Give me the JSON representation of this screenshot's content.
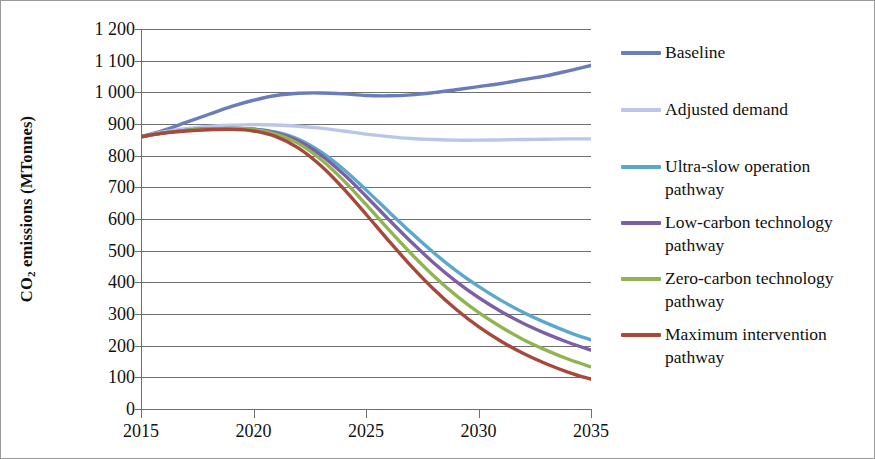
{
  "chart_data": {
    "type": "line",
    "title": "",
    "xlabel": "",
    "ylabel": "CO2 emissions (MTonnes)",
    "ylabel_display": "CO<sub>2</sub> emissions (MTonnes)",
    "grid": true,
    "legend_position": "right",
    "xlim": [
      2014,
      2036
    ],
    "ylim": [
      0,
      1200
    ],
    "ytick_labels": [
      "1 200",
      "1 100",
      "1 000",
      "900",
      "800",
      "700",
      "600",
      "500",
      "400",
      "300",
      "200",
      "100",
      "0"
    ],
    "ytick_values": [
      1200,
      1100,
      1000,
      900,
      800,
      700,
      600,
      500,
      400,
      300,
      200,
      100,
      0
    ],
    "xtick_labels": [
      "2015",
      "2020",
      "2025",
      "2030",
      "2035"
    ],
    "xtick_values": [
      2015,
      2020,
      2025,
      2030,
      2035
    ],
    "x": [
      2015,
      2016,
      2017,
      2018,
      2019,
      2020,
      2021,
      2022,
      2023,
      2024,
      2025,
      2026,
      2027,
      2028,
      2029,
      2030,
      2031,
      2032,
      2033,
      2034,
      2035
    ],
    "series": [
      {
        "name": "Baseline",
        "color": "#6b7cba",
        "values": [
          860,
          880,
          905,
          930,
          955,
          975,
          990,
          997,
          998,
          995,
          990,
          989,
          992,
          999,
          1008,
          1018,
          1028,
          1040,
          1052,
          1068,
          1085
        ]
      },
      {
        "name": "Adjusted demand",
        "color": "#b9c6e8",
        "values": [
          860,
          875,
          885,
          892,
          896,
          898,
          897,
          893,
          887,
          878,
          868,
          860,
          854,
          851,
          849,
          849,
          850,
          851,
          852,
          853,
          853
        ]
      },
      {
        "name": "Ultra-slow operation pathway",
        "color": "#5ba8cc",
        "values": [
          860,
          872,
          880,
          884,
          886,
          884,
          874,
          852,
          812,
          757,
          692,
          624,
          557,
          494,
          437,
          387,
          343,
          305,
          272,
          243,
          218
        ]
      },
      {
        "name": "Low-carbon technology pathway",
        "color": "#7d5fa5",
        "values": [
          860,
          872,
          880,
          884,
          886,
          884,
          872,
          846,
          802,
          742,
          672,
          599,
          528,
          462,
          403,
          352,
          308,
          270,
          238,
          210,
          186
        ]
      },
      {
        "name": "Zero-carbon technology pathway",
        "color": "#8fb451",
        "values": [
          860,
          872,
          880,
          884,
          886,
          883,
          868,
          838,
          788,
          722,
          646,
          567,
          491,
          421,
          359,
          305,
          259,
          219,
          186,
          157,
          133
        ]
      },
      {
        "name": "Maximum intervention pathway",
        "color": "#a8483a",
        "values": [
          860,
          871,
          878,
          882,
          883,
          878,
          860,
          824,
          768,
          696,
          615,
          532,
          452,
          379,
          315,
          260,
          214,
          175,
          143,
          116,
          94
        ]
      }
    ],
    "legend": [
      {
        "label": "Baseline",
        "color": "#6b7cba"
      },
      {
        "label": "Adjusted demand",
        "color": "#b9c6e8"
      },
      {
        "label": "Ultra-slow operation pathway",
        "color": "#5ba8cc"
      },
      {
        "label": "Low-carbon technology pathway",
        "color": "#7d5fa5"
      },
      {
        "label": "Zero-carbon technology pathway",
        "color": "#8fb451"
      },
      {
        "label": "Maximum intervention pathway",
        "color": "#a8483a"
      }
    ]
  }
}
